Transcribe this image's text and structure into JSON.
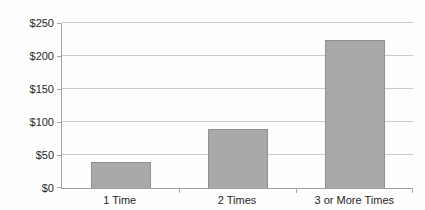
{
  "chart_data": {
    "type": "bar",
    "title": "",
    "xlabel": "",
    "ylabel": "",
    "categories": [
      "1 Time",
      "2 Times",
      "3 or More Times"
    ],
    "values": [
      40,
      90,
      225
    ],
    "ylim": [
      0,
      250
    ],
    "ytick_step": 50,
    "ytick_labels": [
      "$0",
      "$50",
      "$100",
      "$150",
      "$200",
      "$250"
    ],
    "grid": true,
    "legend": "none",
    "colors": {
      "bar_fill": "#a9a9a9",
      "bar_border": "#8f8f8f",
      "gridline": "#cbcbcb",
      "axis": "#a3a3a3",
      "text": "#262626",
      "background": "#fefefe"
    }
  }
}
